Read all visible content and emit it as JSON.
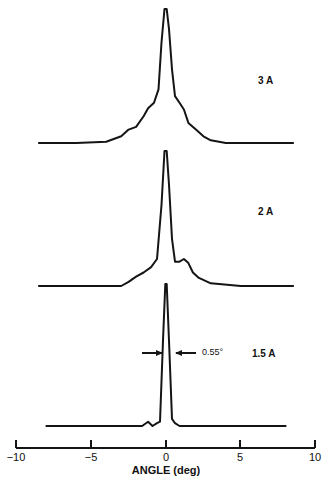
{
  "chart_data": {
    "type": "line",
    "title": "",
    "xlabel": "ANGLE (deg)",
    "ylabel": "",
    "xlim": [
      -10,
      10
    ],
    "xticks": [
      -10,
      -5,
      0,
      5,
      10
    ],
    "xtick_labels": [
      "−10",
      "−5",
      "0",
      "5",
      "10"
    ],
    "grid": false,
    "legend": null,
    "series": [
      {
        "name": "3 A",
        "label": "3 A",
        "baseline_offset": 0,
        "x": [
          -8.5,
          -6,
          -4,
          -3,
          -2.5,
          -2,
          -1.5,
          -1.2,
          -0.8,
          -0.5,
          -0.3,
          -0.1,
          0.05,
          0.2,
          0.4,
          0.6,
          0.9,
          1.2,
          1.5,
          2,
          2.5,
          3,
          4,
          6,
          8.5
        ],
        "y": [
          0.0,
          0.0,
          0.01,
          0.05,
          0.1,
          0.12,
          0.2,
          0.26,
          0.3,
          0.4,
          0.75,
          1.0,
          1.0,
          0.85,
          0.55,
          0.35,
          0.3,
          0.25,
          0.15,
          0.1,
          0.05,
          0.02,
          0.0,
          0.0,
          0.0
        ]
      },
      {
        "name": "2 A",
        "label": "2 A",
        "baseline_offset": 0,
        "x": [
          -8.5,
          -5,
          -3,
          -2.5,
          -2,
          -1.5,
          -1,
          -0.6,
          -0.3,
          -0.1,
          0.05,
          0.2,
          0.4,
          0.6,
          0.9,
          1.2,
          1.5,
          1.8,
          2.2,
          3,
          5,
          8.5
        ],
        "y": [
          0.0,
          0.0,
          0.0,
          0.03,
          0.07,
          0.1,
          0.14,
          0.2,
          0.6,
          1.0,
          1.0,
          0.75,
          0.35,
          0.18,
          0.18,
          0.2,
          0.17,
          0.1,
          0.06,
          0.02,
          0.0,
          0.0
        ]
      },
      {
        "name": "1.5 A",
        "label": "1.5 A",
        "baseline_offset": 0,
        "x": [
          -8,
          -4,
          -2.5,
          -1.6,
          -1.2,
          -0.9,
          -0.6,
          -0.4,
          -0.2,
          -0.05,
          0.05,
          0.2,
          0.4,
          0.6,
          0.9,
          2,
          5,
          8
        ],
        "y": [
          0.0,
          0.0,
          0.0,
          0.0,
          0.03,
          0.0,
          0.02,
          0.03,
          0.6,
          1.0,
          1.0,
          0.6,
          0.05,
          0.02,
          0.0,
          0.0,
          0.0,
          0.0
        ]
      }
    ],
    "annotations": [
      {
        "text": "0.55°",
        "type": "fwhm-arrows",
        "series": "1.5 A",
        "value_deg": 0.55
      }
    ]
  },
  "labels": {
    "curve_3a": "3 A",
    "curve_2a": "2 A",
    "curve_15a": "1.5 A",
    "fwhm": "0.55°",
    "xlabel": "ANGLE (deg)",
    "ticks": [
      "−10",
      "−5",
      "0",
      "5",
      "10"
    ]
  }
}
